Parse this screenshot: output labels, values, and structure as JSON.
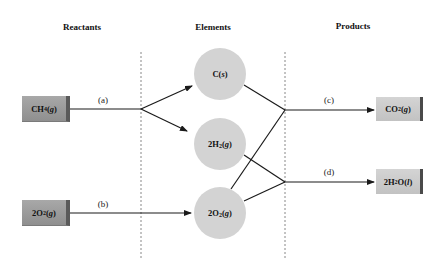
{
  "headings": {
    "reactants": "Reactants",
    "elements": "Elements",
    "products": "Products"
  },
  "reactants": [
    {
      "id": "ch4",
      "formula_main": "CH",
      "sub": "4",
      "state": "g"
    },
    {
      "id": "o2",
      "formula_main": "2O",
      "sub": "2",
      "state": "g"
    }
  ],
  "elements": [
    {
      "id": "c",
      "formula_main": "C",
      "sub": "",
      "state": "s"
    },
    {
      "id": "h2",
      "formula_main": "2H",
      "sub": "2",
      "state": "g"
    },
    {
      "id": "o2",
      "formula_main": "2O",
      "sub": "2",
      "state": "g"
    }
  ],
  "products": [
    {
      "id": "co2",
      "formula_main": "CO",
      "sub": "2",
      "state": "g"
    },
    {
      "id": "h2o",
      "formula_main": "2H",
      "sub": "2",
      "tail": "O",
      "state": "l"
    }
  ],
  "step_labels": {
    "a": "(a)",
    "b": "(b)",
    "c": "(c)",
    "d": "(d)"
  },
  "colors": {
    "circle_fill": "#d3d3d3",
    "reactant_box": "#9a9a9a",
    "product_box": "#cbcbcb",
    "line": "#1a1a1a",
    "separator": "#888888"
  }
}
